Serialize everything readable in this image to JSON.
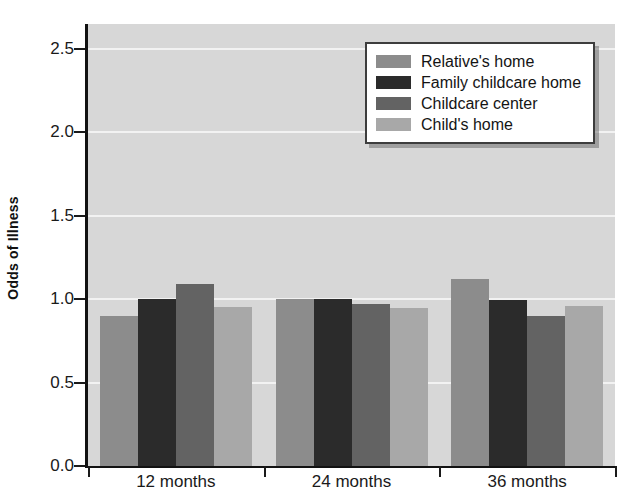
{
  "chart_data": {
    "type": "bar",
    "title": "",
    "xlabel": "",
    "ylabel": "Odds of Illness",
    "categories": [
      "12 months",
      "24 months",
      "36 months"
    ],
    "ylim": [
      0.0,
      2.65
    ],
    "yticks": [
      "0.0",
      "0.5",
      "1.0",
      "1.5",
      "2.0",
      "2.5"
    ],
    "ytick_values": [
      0.0,
      0.5,
      1.0,
      1.5,
      2.0,
      2.5
    ],
    "grid": "horizontal white gridlines on gray plot background",
    "legend_position": "upper right inside plot",
    "series": [
      {
        "name": "Relative's home",
        "color": "#8c8c8c",
        "values": [
          0.9,
          1.0,
          1.12
        ]
      },
      {
        "name": "Family childcare home",
        "color": "#2b2b2b",
        "values": [
          1.0,
          1.0,
          0.995
        ]
      },
      {
        "name": "Childcare center",
        "color": "#636363",
        "values": [
          1.09,
          0.97,
          0.9
        ]
      },
      {
        "name": "Child's home",
        "color": "#a8a8a8",
        "values": [
          0.955,
          0.95,
          0.96
        ]
      }
    ]
  },
  "axis": {
    "y_title": "Odds of Illness"
  },
  "colors": {
    "plot_background": "#d7d7d7",
    "gridline": "#f2f2f2",
    "axis": "#121212",
    "page_background": "#ffffff",
    "legend_border": "#3d3d3d",
    "legend_background": "#ffffff"
  }
}
